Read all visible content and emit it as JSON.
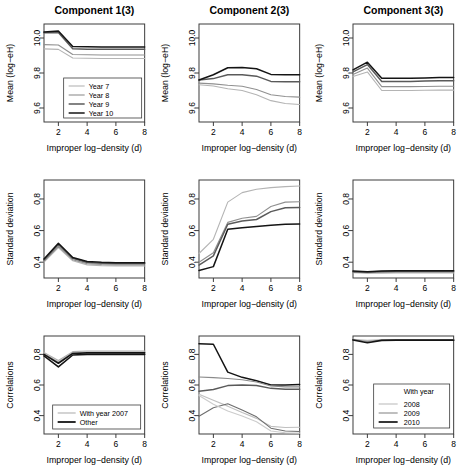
{
  "figure": {
    "columns": [
      "Component 1(3)",
      "Component 2(3)",
      "Component 3(3)"
    ],
    "xlabel": "Improper  log−density (d)",
    "row_ylabels": [
      "Mean (log−eH)",
      "Standard deviation",
      "Correlations"
    ],
    "xticks": [
      "2",
      "4",
      "6",
      "8"
    ],
    "yticks_row1": [
      "9.6",
      "9.8",
      "10.0"
    ],
    "yticks_row2": [
      "0.4",
      "0.6",
      "0.8"
    ],
    "yticks_row3": [
      "0.4",
      "0.6",
      "0.8"
    ],
    "legend_top_left": {
      "items": [
        "Year 7",
        "Year 8",
        "Year 9",
        "Year 10"
      ]
    },
    "legend_bottom_left": {
      "items": [
        "With year 2007",
        "Other"
      ]
    },
    "legend_bottom_right": {
      "header": "With year",
      "items": [
        "2008",
        "2009",
        "2010"
      ]
    },
    "line_colors": [
      "#b4b4b4",
      "#909090",
      "#5a5a5a",
      "#141414"
    ],
    "axis_color": "#3c3c3c"
  },
  "chart_data": [
    {
      "type": "line",
      "title": "Component 1(3)",
      "xlabel": "Improper  log−density (d)",
      "ylabel": "Mean (log−eH)",
      "xlim": [
        1,
        8
      ],
      "ylim": [
        9.52,
        10.08
      ],
      "x": [
        1,
        2,
        3,
        4,
        5,
        6,
        7,
        8
      ],
      "series": [
        {
          "name": "Year 7",
          "values": [
            9.938,
            9.935,
            9.886,
            9.884,
            9.883,
            9.883,
            9.883,
            9.883
          ]
        },
        {
          "name": "Year 8",
          "values": [
            9.962,
            9.96,
            9.906,
            9.904,
            9.903,
            9.903,
            9.903,
            9.903
          ]
        },
        {
          "name": "Year 9",
          "values": [
            10.03,
            10.032,
            9.938,
            9.936,
            9.935,
            9.935,
            9.935,
            9.935
          ]
        },
        {
          "name": "Year 10",
          "values": [
            10.034,
            10.04,
            9.952,
            9.95,
            9.949,
            9.949,
            9.949,
            9.949
          ]
        }
      ]
    },
    {
      "type": "line",
      "title": "Component 2(3)",
      "xlabel": "Improper  log−density (d)",
      "ylabel": "Mean (log−eH)",
      "xlim": [
        1,
        8
      ],
      "ylim": [
        9.52,
        10.08
      ],
      "x": [
        1,
        2,
        3,
        4,
        5,
        6,
        7,
        8
      ],
      "series": [
        {
          "name": "Year 7",
          "values": [
            9.733,
            9.726,
            9.71,
            9.7,
            9.676,
            9.642,
            9.626,
            9.62
          ]
        },
        {
          "name": "Year 8",
          "values": [
            9.742,
            9.738,
            9.73,
            9.724,
            9.706,
            9.676,
            9.666,
            9.662
          ]
        },
        {
          "name": "Year 9",
          "values": [
            9.76,
            9.768,
            9.79,
            9.79,
            9.782,
            9.752,
            9.75,
            9.75
          ]
        },
        {
          "name": "Year 10",
          "values": [
            9.76,
            9.79,
            9.83,
            9.832,
            9.824,
            9.792,
            9.79,
            9.79
          ]
        }
      ]
    },
    {
      "type": "line",
      "title": "Component 3(3)",
      "xlabel": "Improper  log−density (d)",
      "ylabel": "Mean (log−eH)",
      "xlim": [
        1,
        8
      ],
      "ylim": [
        9.52,
        10.08
      ],
      "x": [
        1,
        2,
        3,
        4,
        5,
        6,
        7,
        8
      ],
      "series": [
        {
          "name": "Year 7",
          "values": [
            9.78,
            9.806,
            9.7,
            9.7,
            9.7,
            9.701,
            9.702,
            9.702
          ]
        },
        {
          "name": "Year 8",
          "values": [
            9.792,
            9.828,
            9.722,
            9.722,
            9.722,
            9.723,
            9.724,
            9.724
          ]
        },
        {
          "name": "Year 9",
          "values": [
            9.806,
            9.848,
            9.752,
            9.752,
            9.752,
            9.754,
            9.756,
            9.756
          ]
        },
        {
          "name": "Year 10",
          "values": [
            9.818,
            9.862,
            9.77,
            9.77,
            9.77,
            9.772,
            9.774,
            9.774
          ]
        }
      ]
    },
    {
      "type": "line",
      "title": "Component 1(3)",
      "xlabel": "Improper  log−density (d)",
      "ylabel": "Standard deviation",
      "xlim": [
        1,
        8
      ],
      "ylim": [
        0.3,
        0.92
      ],
      "x": [
        1,
        2,
        3,
        4,
        5,
        6,
        7,
        8
      ],
      "series": [
        {
          "name": "Year 7",
          "values": [
            0.4,
            0.492,
            0.409,
            0.383,
            0.378,
            0.376,
            0.376,
            0.376
          ]
        },
        {
          "name": "Year 8",
          "values": [
            0.406,
            0.5,
            0.416,
            0.39,
            0.385,
            0.383,
            0.383,
            0.383
          ]
        },
        {
          "name": "Year 9",
          "values": [
            0.414,
            0.512,
            0.424,
            0.398,
            0.393,
            0.391,
            0.391,
            0.391
          ]
        },
        {
          "name": "Year 10",
          "values": [
            0.42,
            0.52,
            0.43,
            0.404,
            0.399,
            0.397,
            0.397,
            0.397
          ]
        }
      ]
    },
    {
      "type": "line",
      "title": "Component 2(3)",
      "xlabel": "Improper  log−density (d)",
      "ylabel": "Standard deviation",
      "xlim": [
        1,
        8
      ],
      "ylim": [
        0.3,
        0.92
      ],
      "x": [
        1,
        2,
        3,
        4,
        5,
        6,
        7,
        8
      ],
      "series": [
        {
          "name": "Year 7",
          "values": [
            0.455,
            0.545,
            0.78,
            0.84,
            0.862,
            0.872,
            0.878,
            0.882
          ]
        },
        {
          "name": "Year 8",
          "values": [
            0.4,
            0.46,
            0.652,
            0.678,
            0.69,
            0.752,
            0.78,
            0.782
          ]
        },
        {
          "name": "Year 9",
          "values": [
            0.382,
            0.44,
            0.64,
            0.66,
            0.67,
            0.72,
            0.744,
            0.746
          ]
        },
        {
          "name": "Year 10",
          "values": [
            0.348,
            0.372,
            0.608,
            0.618,
            0.626,
            0.634,
            0.64,
            0.642
          ]
        }
      ]
    },
    {
      "type": "line",
      "title": "Component 3(3)",
      "xlabel": "Improper  log−density (d)",
      "ylabel": "Standard deviation",
      "xlim": [
        1,
        8
      ],
      "ylim": [
        0.3,
        0.92
      ],
      "x": [
        1,
        2,
        3,
        4,
        5,
        6,
        7,
        8
      ],
      "series": [
        {
          "name": "Year 7",
          "values": [
            0.333,
            0.33,
            0.331,
            0.332,
            0.332,
            0.332,
            0.332,
            0.332
          ]
        },
        {
          "name": "Year 8",
          "values": [
            0.336,
            0.334,
            0.336,
            0.337,
            0.337,
            0.337,
            0.337,
            0.337
          ]
        },
        {
          "name": "Year 9",
          "values": [
            0.34,
            0.338,
            0.341,
            0.342,
            0.342,
            0.342,
            0.342,
            0.342
          ]
        },
        {
          "name": "Year 10",
          "values": [
            0.344,
            0.34,
            0.345,
            0.346,
            0.346,
            0.346,
            0.346,
            0.346
          ]
        }
      ]
    },
    {
      "type": "line",
      "title": "Component 1(3)",
      "xlabel": "Improper  log−density (d)",
      "ylabel": "Correlations",
      "xlim": [
        1,
        8
      ],
      "ylim": [
        0.28,
        0.92
      ],
      "x": [
        1,
        2,
        3,
        4,
        5,
        6,
        7,
        8
      ],
      "series": [
        {
          "name": "With year 2007 a",
          "values": [
            0.812,
            0.76,
            0.818,
            0.822,
            0.822,
            0.822,
            0.822,
            0.822
          ]
        },
        {
          "name": "With year 2007 b",
          "values": [
            0.806,
            0.75,
            0.812,
            0.816,
            0.816,
            0.816,
            0.816,
            0.816
          ]
        },
        {
          "name": "Other a",
          "values": [
            0.8,
            0.742,
            0.806,
            0.81,
            0.81,
            0.81,
            0.81,
            0.81
          ]
        },
        {
          "name": "Other b",
          "values": [
            0.79,
            0.718,
            0.796,
            0.8,
            0.8,
            0.8,
            0.8,
            0.8
          ]
        }
      ]
    },
    {
      "type": "line",
      "title": "Component 2(3)",
      "xlabel": "Improper  log−density (d)",
      "ylabel": "Correlations",
      "xlim": [
        1,
        8
      ],
      "ylim": [
        0.28,
        0.92
      ],
      "x": [
        1,
        2,
        3,
        4,
        5,
        6,
        7,
        8
      ],
      "series": [
        {
          "name": "Other a",
          "values": [
            0.87,
            0.866,
            0.684,
            0.65,
            0.628,
            0.6,
            0.6,
            0.604
          ]
        },
        {
          "name": "With year 2007 a",
          "values": [
            0.652,
            0.648,
            0.642,
            0.634,
            0.62,
            0.594,
            0.588,
            0.588
          ]
        },
        {
          "name": "Other b",
          "values": [
            0.56,
            0.57,
            0.596,
            0.6,
            0.596,
            0.578,
            0.572,
            0.572
          ]
        },
        {
          "name": "With year 2007 b",
          "values": [
            0.54,
            0.5,
            0.462,
            0.42,
            0.382,
            0.33,
            0.322,
            0.324
          ]
        },
        {
          "name": "Other c",
          "values": [
            0.396,
            0.452,
            0.478,
            0.436,
            0.392,
            0.318,
            0.3,
            0.296
          ]
        },
        {
          "name": "With year 2007 c",
          "values": [
            0.532,
            0.474,
            0.43,
            0.398,
            0.36,
            0.3,
            0.288,
            0.286
          ]
        }
      ]
    },
    {
      "type": "line",
      "title": "Component 3(3)",
      "xlabel": "Improper  log−density (d)",
      "ylabel": "Correlations",
      "xlim": [
        1,
        8
      ],
      "ylim": [
        0.28,
        0.92
      ],
      "x": [
        1,
        2,
        3,
        4,
        5,
        6,
        7,
        8
      ],
      "series": [
        {
          "name": "2008",
          "values": [
            0.898,
            0.892,
            0.896,
            0.897,
            0.897,
            0.897,
            0.897,
            0.897
          ]
        },
        {
          "name": "2009",
          "values": [
            0.896,
            0.884,
            0.894,
            0.895,
            0.895,
            0.895,
            0.895,
            0.895
          ]
        },
        {
          "name": "2010",
          "values": [
            0.894,
            0.876,
            0.892,
            0.893,
            0.893,
            0.893,
            0.893,
            0.893
          ]
        }
      ]
    }
  ]
}
